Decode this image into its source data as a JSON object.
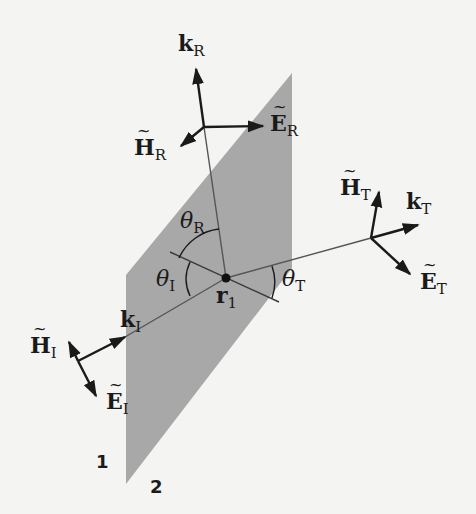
{
  "figure": {
    "colors": {
      "background": "#f4f4f2",
      "plane": "#a8a8a8",
      "ink": "#1a1a1a",
      "ray": "#555555"
    },
    "labels": {
      "k_R": {
        "base": "k",
        "sub": "R"
      },
      "E_R": {
        "base": "E",
        "sub": "R"
      },
      "H_R": {
        "base": "H",
        "sub": "R"
      },
      "k_T": {
        "base": "k",
        "sub": "T"
      },
      "E_T": {
        "base": "E",
        "sub": "T"
      },
      "H_T": {
        "base": "H",
        "sub": "T"
      },
      "k_I": {
        "base": "k",
        "sub": "I"
      },
      "E_I": {
        "base": "E",
        "sub": "I"
      },
      "H_I": {
        "base": "H",
        "sub": "I"
      },
      "theta_R": {
        "base": "θ",
        "sub": "R"
      },
      "theta_I": {
        "base": "θ",
        "sub": "I"
      },
      "theta_T": {
        "base": "θ",
        "sub": "T"
      },
      "r_1": {
        "base": "r",
        "sub": "1"
      },
      "medium_1": "1",
      "medium_2": "2"
    }
  }
}
